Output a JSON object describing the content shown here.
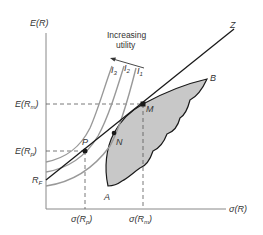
{
  "diagram": {
    "type": "capital-market-line-portfolio-choice",
    "colors": {
      "axis": "#888888",
      "line": "#1a1a1a",
      "curve": "#999999",
      "region_fill": "#c8c8c8",
      "region_stroke": "#1a1a1a",
      "dashed": "#555555",
      "text": "#333333"
    },
    "axes": {
      "y_label": "E(R)",
      "x_label": "σ(R)"
    },
    "y_ticks": {
      "e_rm": {
        "main": "E(R",
        "sub": "m",
        "close": ")"
      },
      "e_rp": {
        "main": "E(R",
        "sub": "p",
        "close": ")"
      },
      "rf": {
        "main": "R",
        "sub": "F"
      }
    },
    "x_ticks": {
      "sigma_rp": {
        "main": "σ(R",
        "sub": "p",
        "close": ")"
      },
      "sigma_rm": {
        "main": "σ(R",
        "sub": "m",
        "close": ")"
      }
    },
    "annotation": {
      "line1": "Increasing",
      "line2": "utility"
    },
    "indifference_curves": [
      {
        "label": "I",
        "sub": "3"
      },
      {
        "label": "I",
        "sub": "2"
      },
      {
        "label": "I",
        "sub": "1"
      }
    ],
    "points": {
      "P": "P",
      "N": "N",
      "M": "M",
      "A": "A",
      "B": "B",
      "Z": "Z"
    }
  }
}
